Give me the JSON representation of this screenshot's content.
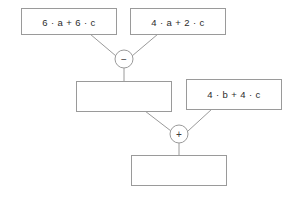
{
  "diagram": {
    "type": "expression-tree",
    "canvas": {
      "width": 295,
      "height": 199,
      "background": "#ffffff"
    },
    "colors": {
      "box_stroke": "#9a9a9a",
      "box_fill": "#ffffff",
      "connector": "#9a9a9a",
      "text": "#2b2b2b",
      "operator_text": "#3c3c3c"
    },
    "nodes": [
      {
        "id": "input-left",
        "label": "6 · a + 6 · c",
        "empty": false,
        "x": 21,
        "y": 8,
        "width": 95,
        "height": 26
      },
      {
        "id": "input-right",
        "label": "4 · a + 2 · c",
        "empty": false,
        "x": 130,
        "y": 8,
        "width": 95,
        "height": 26
      },
      {
        "id": "intermediate-result",
        "label": "",
        "empty": true,
        "x": 76,
        "y": 81,
        "width": 95,
        "height": 30
      },
      {
        "id": "input-addend",
        "label": "4 · b + 4 · c",
        "empty": false,
        "x": 186,
        "y": 79,
        "width": 95,
        "height": 30
      },
      {
        "id": "final-result",
        "label": "",
        "empty": true,
        "x": 131,
        "y": 155,
        "width": 95,
        "height": 30
      }
    ],
    "operators": [
      {
        "id": "subtract",
        "symbol": "−",
        "name": "minus",
        "cx": 124,
        "cy": 59,
        "r": 9,
        "inputs": [
          "input-left",
          "input-right"
        ],
        "output": "intermediate-result"
      },
      {
        "id": "add",
        "symbol": "+",
        "name": "plus",
        "cx": 179,
        "cy": 134,
        "r": 9,
        "inputs": [
          "intermediate-result",
          "input-addend"
        ],
        "output": "final-result"
      }
    ],
    "edges": [
      {
        "id": "edge-left-to-minus",
        "x1": 90,
        "y1": 34,
        "x2": 116,
        "y2": 56
      },
      {
        "id": "edge-right-to-minus",
        "x1": 158,
        "y1": 34,
        "x2": 132,
        "y2": 56
      },
      {
        "id": "edge-minus-to-intermediate",
        "x1": 124,
        "y1": 68,
        "x2": 124,
        "y2": 81
      },
      {
        "id": "edge-intermediate-to-plus",
        "x1": 145,
        "y1": 111,
        "x2": 171,
        "y2": 131
      },
      {
        "id": "edge-addend-to-plus",
        "x1": 212,
        "y1": 109,
        "x2": 188,
        "y2": 131
      },
      {
        "id": "edge-plus-to-final",
        "x1": 179,
        "y1": 143,
        "x2": 179,
        "y2": 155
      }
    ]
  }
}
